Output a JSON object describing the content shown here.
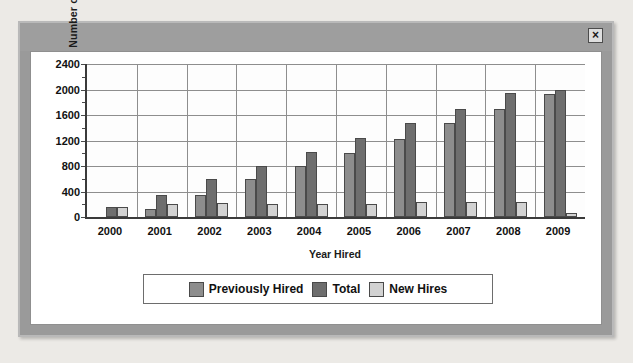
{
  "window": {
    "close_label": "×"
  },
  "chart_data": {
    "type": "bar",
    "title": "",
    "xlabel": "Year Hired",
    "ylabel": "Number of employees",
    "categories": [
      "2000",
      "2001",
      "2002",
      "2003",
      "2004",
      "2005",
      "2006",
      "2007",
      "2008",
      "2009"
    ],
    "yticks": [
      0,
      400,
      800,
      1200,
      1600,
      2000,
      2400
    ],
    "ylim": [
      0,
      2400
    ],
    "grid": true,
    "legend_position": "bottom",
    "series": [
      {
        "name": "Previously Hired",
        "color": "#8d8d8d",
        "values": [
          0,
          130,
          350,
          590,
          800,
          1010,
          1230,
          1470,
          1700,
          1930
        ]
      },
      {
        "name": "Total",
        "color": "#6e6e6e",
        "values": [
          150,
          350,
          600,
          800,
          1020,
          1240,
          1470,
          1700,
          1940,
          2000
        ]
      },
      {
        "name": "New Hires",
        "color": "#d2d2d2",
        "values": [
          150,
          200,
          220,
          200,
          200,
          200,
          230,
          230,
          230,
          60
        ]
      }
    ]
  }
}
